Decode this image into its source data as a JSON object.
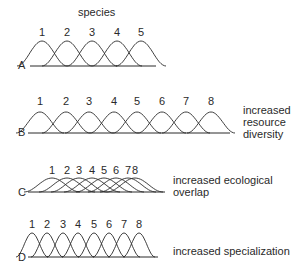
{
  "title": "species",
  "stroke_color": "#2a2a2a",
  "panels": [
    {
      "letter": "A",
      "species": [
        "1",
        "2",
        "3",
        "4",
        "5"
      ],
      "baseline_y": 66,
      "peak_y": 41,
      "label_y": 26,
      "x0": 30,
      "x1": 156,
      "centers": [
        42,
        67,
        92,
        117,
        141
      ],
      "half_width": 25,
      "caption": []
    },
    {
      "letter": "B",
      "species": [
        "1",
        "2",
        "3",
        "4",
        "5",
        "6",
        "7",
        "8"
      ],
      "baseline_y": 133,
      "peak_y": 112,
      "label_y": 95,
      "x0": 28,
      "x1": 230,
      "centers": [
        40,
        66,
        89,
        114,
        137,
        162,
        186,
        211
      ],
      "half_width": 24,
      "caption": [
        "increased",
        "resource",
        "diversity"
      ]
    },
    {
      "letter": "C",
      "species": [
        "1",
        "2",
        "3",
        "4",
        "5",
        "6",
        "7",
        "8"
      ],
      "baseline_y": 192,
      "peak_y": 178,
      "label_y": 164,
      "x0": 28,
      "x1": 165,
      "centers": [
        52,
        67,
        79,
        92,
        104,
        116,
        128,
        135
      ],
      "half_width": 28,
      "caption": [
        "increased ecological",
        "overlap"
      ]
    },
    {
      "letter": "D",
      "species": [
        "1",
        "2",
        "3",
        "4",
        "5",
        "6",
        "7",
        "8"
      ],
      "baseline_y": 257,
      "peak_y": 233,
      "label_y": 218,
      "x0": 28,
      "x1": 158,
      "centers": [
        32,
        47,
        63,
        78,
        94,
        109,
        124,
        139
      ],
      "half_width": 16,
      "caption": [
        "increased specialization"
      ]
    }
  ]
}
